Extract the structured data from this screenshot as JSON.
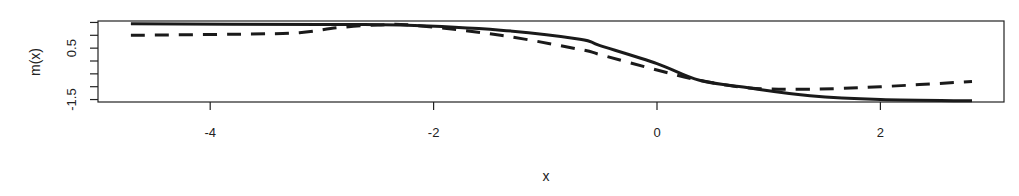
{
  "chart_data": {
    "type": "line",
    "title": "",
    "xlabel": "x",
    "ylabel": "m(x)",
    "xlim": [
      -4.75,
      2.85
    ],
    "ylim": [
      -1.6,
      1.6
    ],
    "x_ticks": [
      -4,
      -2,
      0,
      2
    ],
    "x_tick_labels": [
      "-4",
      "-2",
      "0",
      "2"
    ],
    "y_ticks": [
      1.5,
      1.0,
      0.5,
      0.0,
      -0.5,
      -1.0,
      -1.5
    ],
    "y_tick_labels": [
      "",
      "",
      "0.5",
      "",
      "",
      "",
      "-1.5"
    ],
    "grid": false,
    "legend": null,
    "series": [
      {
        "name": "solid",
        "style": "solid",
        "color": "#1a1a1a",
        "x": [
          -4.71,
          -3.0,
          -2.3,
          -1.4,
          -0.69,
          -0.51,
          0.0,
          0.38,
          0.83,
          1.37,
          2.0,
          2.82
        ],
        "y": [
          1.45,
          1.42,
          1.4,
          1.2,
          0.85,
          0.6,
          -0.1,
          -0.75,
          -1.05,
          -1.35,
          -1.5,
          -1.55
        ]
      },
      {
        "name": "dashed",
        "style": "dashed",
        "color": "#1a1a1a",
        "x": [
          -4.71,
          -3.64,
          -3.2,
          -2.85,
          -2.5,
          -2.2,
          -1.4,
          -0.69,
          -0.51,
          0.0,
          0.38,
          0.83,
          1.37,
          2.0,
          2.82
        ],
        "y": [
          1.0,
          1.05,
          1.1,
          1.3,
          1.4,
          1.4,
          1.0,
          0.45,
          0.25,
          -0.35,
          -0.75,
          -1.05,
          -1.1,
          -1.0,
          -0.8
        ]
      }
    ]
  }
}
